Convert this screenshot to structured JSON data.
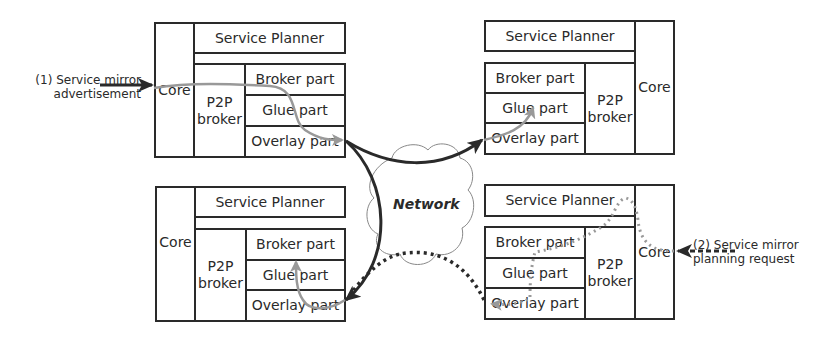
{
  "nodes": [
    {
      "id": "top-left",
      "core": "Core",
      "service_planner": "Service Planner",
      "p2p_broker": "P2P broker",
      "broker_part": "Broker part",
      "glue_part": "Glue part",
      "overlay_part": "Overlay part"
    },
    {
      "id": "top-right",
      "core": "Core",
      "service_planner": "Service Planner",
      "p2p_broker": "P2P broker",
      "broker_part": "Broker part",
      "glue_part": "Glue part",
      "overlay_part": "Overlay part"
    },
    {
      "id": "bottom-left",
      "core": "Core",
      "service_planner": "Service Planner",
      "p2p_broker": "P2P broker",
      "broker_part": "Broker part",
      "glue_part": "Glue part",
      "overlay_part": "Overlay part"
    },
    {
      "id": "bottom-right",
      "core": "Core",
      "service_planner": "Service Planner",
      "p2p_broker": "P2P broker",
      "broker_part": "Broker part",
      "glue_part": "Glue part",
      "overlay_part": "Overlay part"
    }
  ],
  "network": {
    "label": "Network"
  },
  "annotations": {
    "advertisement_line1": "(1) Service mirror",
    "advertisement_line2": "advertisement",
    "planning_line1": "(2) Service mirror",
    "planning_line2": "planning request"
  },
  "colors": {
    "border": "#2a2a2a",
    "solid_arrow": "#2a2a2a",
    "gray_path": "#999999",
    "cloud": "#888888"
  }
}
